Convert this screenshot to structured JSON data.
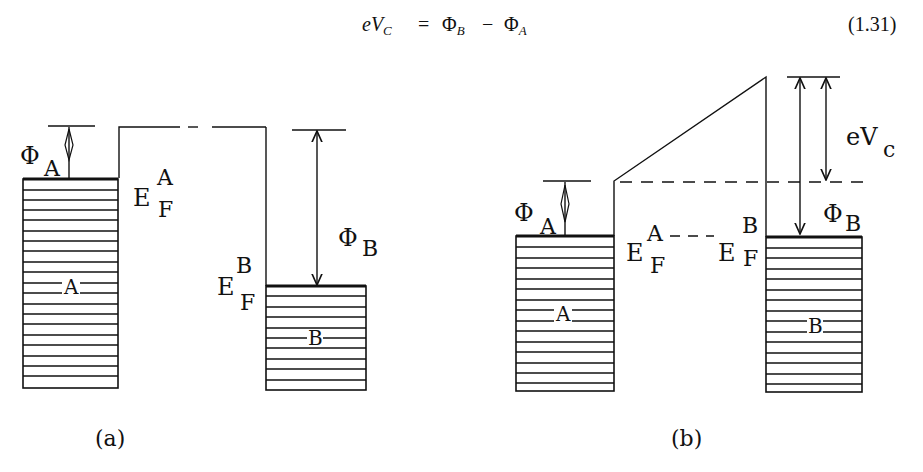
{
  "equation": {
    "lhs_e": "e",
    "lhs_V": "V",
    "lhs_sub": "C",
    "equals": "=",
    "phi1": "Φ",
    "phi1_sub": "B",
    "minus": "−",
    "phi2": "Φ",
    "phi2_sub": "A",
    "number": "(1.31)"
  },
  "panel_a": {
    "caption": "(a)",
    "phiA": "Φ",
    "phiA_sub": "A",
    "efA_E": "E",
    "efA_sup": "A",
    "efA_sub": "F",
    "efB_E": "E",
    "efB_sup": "B",
    "efB_sub": "F",
    "phiB": "Φ",
    "phiB_sub": "B",
    "metalA_label": "A",
    "metalB_label": "B"
  },
  "panel_b": {
    "caption": "(b)",
    "phiA": "Φ",
    "phiA_sub": "A",
    "efA_E": "E",
    "efA_sup": "A",
    "efA_sub": "F",
    "efB_E": "E",
    "efB_sup": "B",
    "efB_sub": "F",
    "phiB": "Φ",
    "phiB_sub": "B",
    "evc_e": "eV",
    "evc_sub": "c",
    "metalA_label": "A",
    "metalB_label": "B"
  },
  "colors": {
    "ink": "#111111",
    "background": "#ffffff"
  }
}
